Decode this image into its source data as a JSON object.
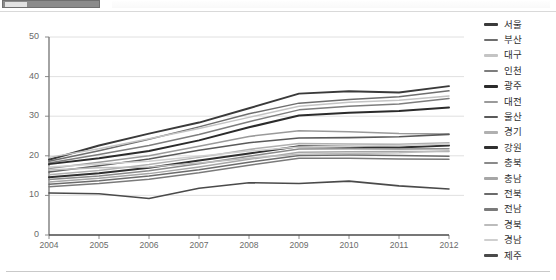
{
  "toolbar": {
    "chip_label": "",
    "visible": true
  },
  "chart_data": {
    "type": "line",
    "title": "",
    "subtitle": "",
    "xlabel": "",
    "ylabel": "",
    "grid": true,
    "legend_position": "right",
    "xlim": [
      2004,
      2012
    ],
    "ylim": [
      0,
      50
    ],
    "yticks": [
      "0",
      "10",
      "20",
      "30",
      "40",
      "50"
    ],
    "ytick_values": [
      0,
      10,
      20,
      30,
      40,
      50
    ],
    "categories": [
      "2004",
      "2005",
      "2006",
      "2007",
      "2008",
      "2009",
      "2010",
      "2011",
      "2012"
    ],
    "x": [
      2004,
      2005,
      2006,
      2007,
      2008,
      2009,
      2010,
      2011,
      2012
    ],
    "series": [
      {
        "name": "서울",
        "color": "#3a3a3a",
        "width": 1.9,
        "values": [
          19.0,
          22.6,
          25.6,
          28.4,
          32.0,
          35.7,
          36.3,
          36.0,
          37.6
        ]
      },
      {
        "name": "부산",
        "color": "#6e6e6e",
        "width": 1.5,
        "values": [
          18.6,
          21.3,
          24.2,
          27.3,
          30.6,
          33.3,
          34.2,
          34.9,
          36.4
        ]
      },
      {
        "name": "대구",
        "color": "#c4c4c4",
        "width": 1.5,
        "values": [
          19.6,
          21.8,
          24.3,
          26.9,
          29.7,
          32.5,
          33.5,
          34.0,
          35.1
        ]
      },
      {
        "name": "인천",
        "color": "#7d7d7d",
        "width": 1.5,
        "values": [
          18.2,
          20.3,
          22.6,
          25.4,
          28.6,
          31.6,
          32.5,
          33.1,
          34.5
        ]
      },
      {
        "name": "광주",
        "color": "#2b2b2b",
        "width": 2.0,
        "values": [
          17.9,
          19.4,
          21.2,
          23.9,
          27.2,
          30.2,
          30.9,
          31.3,
          32.2
        ]
      },
      {
        "name": "대전",
        "color": "#9a9a9a",
        "width": 1.5,
        "values": [
          16.8,
          18.4,
          20.0,
          22.4,
          24.9,
          26.3,
          26.1,
          25.6,
          25.5
        ]
      },
      {
        "name": "울산",
        "color": "#5a5a5a",
        "width": 1.6,
        "values": [
          15.9,
          17.5,
          19.2,
          21.4,
          23.3,
          24.5,
          24.6,
          24.8,
          25.4
        ]
      },
      {
        "name": "경기",
        "color": "#b0b0b0",
        "width": 1.5,
        "values": [
          15.2,
          16.3,
          17.8,
          19.6,
          21.6,
          23.1,
          23.0,
          22.9,
          23.3
        ]
      },
      {
        "name": "강원",
        "color": "#2f2f2f",
        "width": 2.0,
        "values": [
          14.6,
          15.6,
          17.0,
          18.8,
          20.6,
          22.4,
          22.3,
          22.1,
          22.6
        ]
      },
      {
        "name": "충북",
        "color": "#8a8a8a",
        "width": 1.5,
        "values": [
          14.0,
          14.9,
          16.2,
          18.0,
          19.9,
          21.7,
          21.8,
          21.7,
          21.8
        ]
      },
      {
        "name": "충남",
        "color": "#a6a6a6",
        "width": 1.5,
        "values": [
          13.4,
          14.3,
          15.5,
          17.2,
          19.1,
          20.9,
          21.0,
          21.1,
          21.1
        ]
      },
      {
        "name": "전북",
        "color": "#6b6b6b",
        "width": 1.5,
        "values": [
          12.8,
          13.7,
          14.9,
          16.5,
          18.4,
          20.1,
          20.2,
          20.1,
          19.9
        ]
      },
      {
        "name": "전남",
        "color": "#7a7a7a",
        "width": 1.5,
        "values": [
          12.2,
          13.0,
          14.1,
          15.7,
          17.6,
          19.4,
          19.4,
          19.2,
          19.1
        ]
      },
      {
        "name": "경북",
        "color": "#bcbcbc",
        "width": 1.5,
        "values": [
          16.4,
          17.0,
          17.2,
          18.2,
          19.4,
          20.4,
          20.6,
          20.8,
          21.3
        ]
      },
      {
        "name": "경남",
        "color": "#cfcfcf",
        "width": 1.5,
        "values": [
          17.2,
          17.9,
          18.6,
          19.9,
          21.2,
          22.2,
          22.4,
          22.6,
          23.0
        ]
      },
      {
        "name": "제주",
        "color": "#4a4a4a",
        "width": 1.6,
        "values": [
          10.6,
          10.4,
          9.2,
          11.8,
          13.2,
          13.0,
          13.6,
          12.4,
          11.6
        ]
      }
    ]
  }
}
